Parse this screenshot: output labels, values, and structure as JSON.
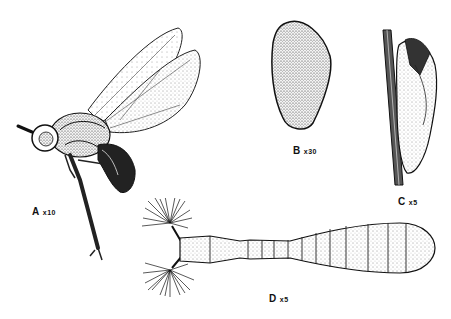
{
  "figure": {
    "panels": [
      {
        "id": "A",
        "letter": "A",
        "magnification": "x10",
        "subject": "adult fly"
      },
      {
        "id": "B",
        "letter": "B",
        "magnification": "x30",
        "subject": "egg"
      },
      {
        "id": "C",
        "letter": "C",
        "magnification": "x5",
        "subject": "pupa on stem"
      },
      {
        "id": "D",
        "letter": "D",
        "magnification": "x5",
        "subject": "larva"
      }
    ]
  }
}
